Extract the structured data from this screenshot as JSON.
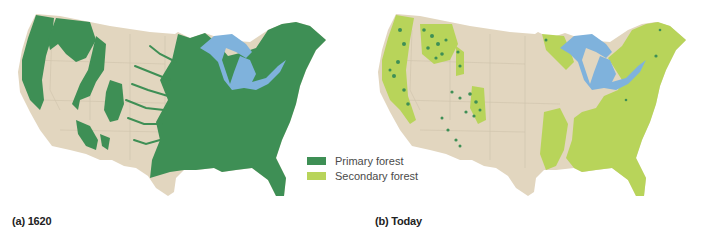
{
  "figure": {
    "panels": [
      {
        "id": "a",
        "caption": "(a) 1620",
        "description": "Extent of primary forest in the contiguous United States in 1620"
      },
      {
        "id": "b",
        "caption": "(b) Today",
        "description": "Extent of primary and secondary forest in the contiguous United States today"
      }
    ],
    "legend": {
      "items": [
        {
          "label": "Primary forest",
          "color": "#3e8f55"
        },
        {
          "label": "Secondary forest",
          "color": "#b8d45a"
        }
      ]
    },
    "colors": {
      "land": "#e2d6bf",
      "lakes": "#7fb2dc",
      "primary_forest": "#3e8f55",
      "secondary_forest": "#b8d45a",
      "state_borders": "#cfc3ab"
    }
  }
}
